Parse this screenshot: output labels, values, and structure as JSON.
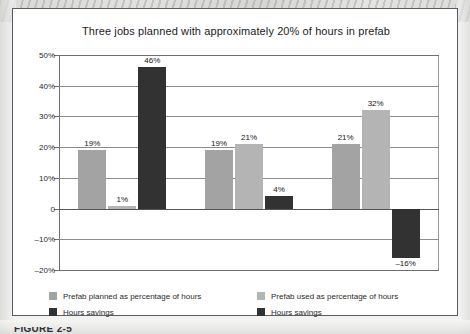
{
  "figure": {
    "caption_partial": "FIGURE 2-5"
  },
  "chart_data": {
    "type": "bar",
    "title": "Three jobs planned with approximately 20% of hours in prefab",
    "xlabel": "",
    "ylabel": "",
    "ylim": [
      -20,
      50
    ],
    "grid": true,
    "legend_position": "bottom",
    "categories": [
      "Job 1",
      "Job 2",
      "Job 3"
    ],
    "yticks": [
      {
        "value": 50,
        "label": "50%"
      },
      {
        "value": 40,
        "label": "40%"
      },
      {
        "value": 30,
        "label": "30%"
      },
      {
        "value": 20,
        "label": "20%"
      },
      {
        "value": 10,
        "label": "10%"
      },
      {
        "value": 0,
        "label": "0"
      },
      {
        "value": -10,
        "label": "–10%"
      },
      {
        "value": -20,
        "label": "–20%"
      }
    ],
    "series": [
      {
        "name": "Prefab planned as percentage of hours",
        "color": "#a3a3a3",
        "values": [
          19,
          19,
          21
        ],
        "labels": [
          "19%",
          "19%",
          "21%"
        ]
      },
      {
        "name": "Prefab used as percentage of hours",
        "color": "#b4b4b4",
        "values": [
          1,
          21,
          32
        ],
        "labels": [
          "1%",
          "21%",
          "32%"
        ]
      },
      {
        "name": "Hours savings",
        "color": "#323232",
        "values": [
          46,
          4,
          -16
        ],
        "labels": [
          "46%",
          "4%",
          "–16%"
        ]
      }
    ]
  },
  "legend": {
    "left": [
      {
        "label": "Prefab planned as percentage of hours",
        "swatch": "planned"
      },
      {
        "label": "Hours savings",
        "swatch": "savings"
      }
    ],
    "right": [
      {
        "label": "Prefab used as percentage of hours",
        "swatch": "used"
      },
      {
        "label": "Hours savings",
        "swatch": "savings"
      }
    ]
  },
  "colors": {
    "planned": "#a3a3a3",
    "used": "#b4b4b4",
    "savings": "#323232",
    "frame": "#5a5a68",
    "grid": "#8c8c90"
  }
}
